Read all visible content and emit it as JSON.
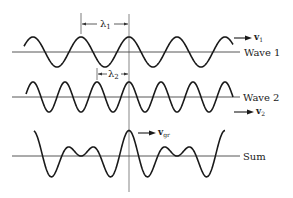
{
  "diagram": {
    "wave1": {
      "label": "Wave 1",
      "velocity_label": "v",
      "velocity_sub": "1",
      "wavelength_label": "λ",
      "wavelength_sub": "1"
    },
    "wave2": {
      "label": "Wave 2",
      "velocity_label": "v",
      "velocity_sub": "2",
      "wavelength_label": "λ",
      "wavelength_sub": "2"
    },
    "sum": {
      "label": "Sum",
      "velocity_label": "v",
      "velocity_sub": "gr"
    },
    "colors": {
      "stroke": "#1a1a1a",
      "axis": "#444444"
    }
  }
}
